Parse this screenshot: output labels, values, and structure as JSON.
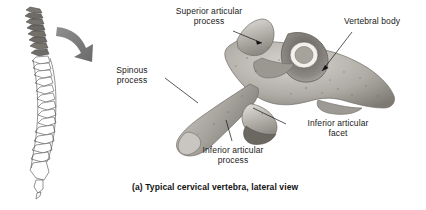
{
  "figure": {
    "caption": "(a) Typical cervical vertebra, lateral view",
    "background_color": "#ffffff",
    "text_color": "#1a1a1a"
  },
  "labels": [
    {
      "id": "superior-articular-process",
      "text": "Superior articular\nprocess",
      "position": "top-center"
    },
    {
      "id": "vertebral-body",
      "text": "Vertebral body",
      "position": "top-right"
    },
    {
      "id": "spinous-process",
      "text": "Spinous\nprocess",
      "position": "middle-left"
    },
    {
      "id": "inferior-articular-facet",
      "text": "Inferior articular\nfacet",
      "position": "bottom-right"
    },
    {
      "id": "inferior-articular-process",
      "text": "Inferior articular\nprocess",
      "position": "bottom-center"
    }
  ],
  "illustrations": {
    "spine": {
      "name": "vertebral-column-lateral",
      "regions": [
        "cervical",
        "thoracic",
        "lumbar",
        "sacrum"
      ],
      "highlight_color": "#6e6e6e"
    },
    "arrow": {
      "name": "zoom-indicator-arrow",
      "color": "#8a8a8a",
      "direction": "down-right"
    },
    "vertebra": {
      "name": "cervical-vertebra-lateral",
      "bone_color": "#b8b5b0"
    }
  }
}
